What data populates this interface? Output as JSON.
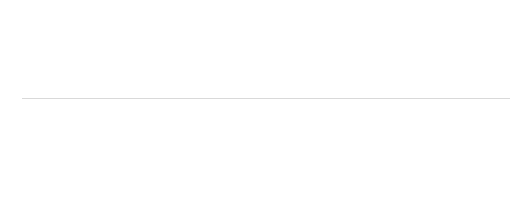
{
  "subtitle": "(% of GDP)",
  "chart_data": {
    "type": "bar",
    "stacked": true,
    "title": "",
    "subtitle": "(% of GDP)",
    "xlabel": "",
    "ylabel": "",
    "ylim": [
      0,
      60
    ],
    "yticks": [
      0,
      20,
      40,
      60
    ],
    "grid": true,
    "legend_position": "bottom-center",
    "colors": {
      "social_contributions": "#d6d6d6",
      "taxes_production_imports": "#ababab",
      "current_taxes_income_wealth": "#797979"
    },
    "categories": [
      "EU-27",
      "Euro area",
      "Belgium",
      "Bulgaria",
      "Czech Republic",
      "Denmark",
      "Germany",
      "Estonia",
      "Ireland",
      "Greece",
      "Spain",
      "France",
      "Italy",
      "Cyprus",
      "Latvia",
      "Lithuania",
      "Luxembourg",
      "Hungary",
      "Malta",
      "Netherlands",
      "Austria",
      "Poland",
      "Portugal",
      "Romania",
      "Slovenia",
      "Slovakia",
      "Finland",
      "Sweden",
      "United Kingdom",
      "Iceland",
      "Norway"
    ],
    "series": [
      {
        "name": "Current taxes on income and wealth",
        "key": "current_taxes_income_wealth",
        "values": [
          12.4,
          12.1,
          16.5,
          5.3,
          8.6,
          29.4,
          11.3,
          7.1,
          10.8,
          8.1,
          10.0,
          11.4,
          14.6,
          11.0,
          8.3,
          8.8,
          13.4,
          9.8,
          8.1,
          11.4,
          12.8,
          6.8,
          8.5,
          6.2,
          7.6,
          5.8,
          16.3,
          18.6,
          14.7,
          17.9,
          20.9
        ]
      },
      {
        "name": "Taxes on production and imports (1)",
        "key": "taxes_production_imports",
        "values": [
          13.1,
          12.9,
          13.1,
          15.2,
          11.2,
          17.2,
          11.3,
          14.0,
          11.5,
          12.5,
          10.2,
          15.2,
          14.1,
          15.2,
          11.4,
          11.9,
          12.8,
          15.6,
          13.6,
          11.8,
          14.4,
          13.6,
          13.9,
          11.3,
          14.1,
          10.6,
          13.3,
          17.9,
          12.6,
          15.8,
          11.9
        ]
      },
      {
        "name": "Social contributions",
        "key": "social_contributions",
        "values": [
          14.2,
          15.4,
          14.4,
          11.5,
          15.2,
          1.0,
          16.4,
          12.9,
          6.2,
          12.5,
          13.0,
          18.4,
          13.7,
          8.4,
          9.8,
          11.0,
          11.5,
          12.8,
          6.3,
          14.4,
          15.4,
          11.6,
          11.9,
          9.8,
          15.3,
          12.2,
          12.6,
          7.4,
          7.9,
          5.3,
          9.6
        ]
      }
    ]
  },
  "legend": {
    "items": [
      {
        "label": "Social contributions",
        "key": "social_contributions"
      },
      {
        "label": "Taxes on production and imports (1)",
        "key": "taxes_production_imports"
      },
      {
        "label": "Current taxes on income and wealth",
        "key": "current_taxes_income_wealth"
      }
    ]
  }
}
